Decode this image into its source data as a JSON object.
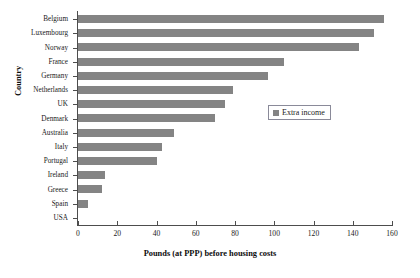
{
  "chart_data": {
    "type": "bar",
    "orientation": "horizontal",
    "title": "",
    "xlabel": "Pounds (at PPP) before housing costs",
    "ylabel": "Country",
    "xlim": [
      0,
      160
    ],
    "xticks": [
      0,
      20,
      40,
      60,
      80,
      100,
      120,
      140,
      160
    ],
    "grid": false,
    "legend": {
      "position": "center-right-inside",
      "entries": [
        "Extra income"
      ]
    },
    "series": [
      {
        "name": "Extra income",
        "color": "#848484",
        "values": [
          156,
          151,
          143,
          105,
          97,
          79,
          75,
          70,
          49,
          43,
          40,
          14,
          12,
          5,
          0
        ]
      }
    ],
    "categories": [
      "Belgium",
      "Luxembourg",
      "Norway",
      "France",
      "Germany",
      "Netherlands",
      "UK",
      "Denmark",
      "Australia",
      "Italy",
      "Portugal",
      "Ireland",
      "Greece",
      "Spain",
      "USA"
    ]
  },
  "colors": {
    "bar": "#848484",
    "axis": "#4d4d4d",
    "text": "#1a1a1a",
    "legend_border": "#8a8a99",
    "background": "#ffffff"
  }
}
